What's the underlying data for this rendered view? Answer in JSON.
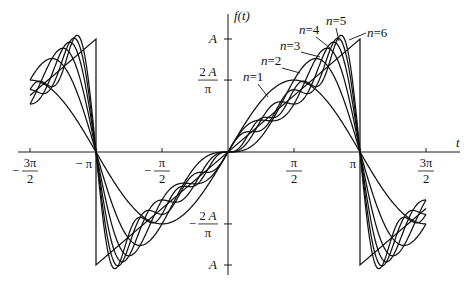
{
  "chart_data": {
    "type": "line",
    "title": "",
    "xlabel": "t",
    "ylabel": "f(t)",
    "xlim": [
      -1.65,
      1.75
    ],
    "x_unit": "pi",
    "ylim": [
      -1.1,
      1.15
    ],
    "y_unit": "A",
    "grid": false,
    "legend": "inline labels with leader lines",
    "x_ticks": [
      {
        "value": -1.5,
        "num": "3π",
        "den": "2",
        "sign": "−"
      },
      {
        "value": -1.0,
        "text": "− π"
      },
      {
        "value": -0.5,
        "num": "π",
        "den": "2",
        "sign": "−"
      },
      {
        "value": 0.5,
        "num": "π",
        "den": "2",
        "sign": ""
      },
      {
        "value": 1.0,
        "text": "π"
      },
      {
        "value": 1.5,
        "num": "3π",
        "den": "2",
        "sign": ""
      }
    ],
    "y_ticks": [
      {
        "value": 1.0,
        "text": "A"
      },
      {
        "value": 0.6366,
        "num": "2 A",
        "den": "π",
        "sign": ""
      },
      {
        "value": -0.6366,
        "num": "2 A",
        "den": "π",
        "sign": "−"
      },
      {
        "value": -1.0,
        "text": "A"
      }
    ],
    "series": [
      {
        "name": "n=1",
        "n": 1
      },
      {
        "name": "n=2",
        "n": 2
      },
      {
        "name": "n=3",
        "n": 3
      },
      {
        "name": "n=4",
        "n": 4
      },
      {
        "name": "n=5",
        "n": 5
      },
      {
        "name": "n=6",
        "n": 6
      },
      {
        "name": "sawtooth",
        "points_t_over_pi": [
          [
            -1.0,
            -1.0
          ],
          [
            1.0,
            1.0
          ]
        ],
        "periodic": true
      }
    ],
    "curve_range_t_over_pi": [
      -1.5,
      1.5
    ],
    "labels": [
      {
        "text": "n=1",
        "x": 243,
        "y": 81,
        "leader": [
          [
            258,
            84
          ],
          [
            268,
            97
          ]
        ]
      },
      {
        "text": "n=2",
        "x": 261,
        "y": 65,
        "leader": [
          [
            282,
            68
          ],
          [
            300,
            73
          ]
        ]
      },
      {
        "text": "n=3",
        "x": 280,
        "y": 50,
        "leader": [
          [
            301,
            52
          ],
          [
            320,
            57
          ]
        ]
      },
      {
        "text": "n=4",
        "x": 299,
        "y": 34,
        "leader": [
          [
            316,
            37
          ],
          [
            330,
            48
          ]
        ]
      },
      {
        "text": "n=5",
        "x": 326,
        "y": 25,
        "leader": [
          [
            336,
            28
          ],
          [
            339,
            41
          ]
        ]
      },
      {
        "text": "n=6",
        "x": 367,
        "y": 37,
        "leader": [
          [
            366,
            33
          ],
          [
            349,
            40
          ]
        ]
      }
    ],
    "axis_labels": {
      "x": "t",
      "y": "f(t)"
    }
  },
  "layout": {
    "origin_px": [
      228,
      152
    ],
    "pi_px": 132,
    "A_px": 113
  }
}
